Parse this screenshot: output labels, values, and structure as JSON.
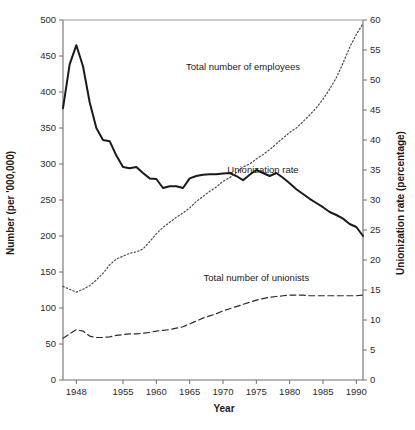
{
  "chart_data": {
    "type": "line",
    "title": "",
    "xlabel": "Year",
    "ylabel": "Number (per '000,000)",
    "y2label": "Unionization rate (percentage)",
    "xlim": [
      1946,
      1991
    ],
    "ylim": [
      0,
      500
    ],
    "y2lim": [
      0,
      60
    ],
    "grid": false,
    "legend_position": "inline-annotations",
    "xticks": [
      1948,
      1955,
      1960,
      1965,
      1970,
      1975,
      1980,
      1985,
      1990
    ],
    "xtick_labels": [
      "1948",
      "1955",
      "1960",
      "1965",
      "1970",
      "1975",
      "1980",
      "1985",
      "1990"
    ],
    "yticks": [
      0,
      50,
      100,
      150,
      200,
      250,
      300,
      350,
      400,
      450,
      500
    ],
    "ytick_labels": [
      "0",
      "50",
      "100",
      "150",
      "200",
      "250",
      "300",
      "350",
      "400",
      "450",
      "500"
    ],
    "y2ticks": [
      0,
      5,
      10,
      15,
      20,
      25,
      30,
      35,
      40,
      45,
      50,
      55,
      60
    ],
    "y2tick_labels": [
      "0",
      "5",
      "10",
      "15",
      "20",
      "25",
      "30",
      "35",
      "40",
      "45",
      "50",
      "55",
      "60"
    ],
    "x": [
      1946,
      1947,
      1948,
      1949,
      1950,
      1951,
      1952,
      1953,
      1954,
      1955,
      1956,
      1957,
      1958,
      1959,
      1960,
      1961,
      1962,
      1963,
      1964,
      1965,
      1966,
      1967,
      1968,
      1969,
      1970,
      1971,
      1972,
      1973,
      1974,
      1975,
      1976,
      1977,
      1978,
      1979,
      1980,
      1981,
      1982,
      1983,
      1984,
      1985,
      1986,
      1987,
      1988,
      1989,
      1990,
      1991
    ],
    "series": [
      {
        "name": "Unionization rate",
        "axis": "right",
        "style": "solid",
        "color": "#1a1a1a",
        "annotation": "Unionization rate",
        "annotation_x": 1976,
        "annotation_y": 34.5,
        "values": [
          45.3,
          52.6,
          55.8,
          52.3,
          46.3,
          42.0,
          40.0,
          39.8,
          37.4,
          35.5,
          35.3,
          35.5,
          34.5,
          33.6,
          33.5,
          32.0,
          32.3,
          32.3,
          32.0,
          33.6,
          34.0,
          34.2,
          34.3,
          34.3,
          34.4,
          34.5,
          34.0,
          33.3,
          34.2,
          35.0,
          34.5,
          34.0,
          34.5,
          33.7,
          32.8,
          31.8,
          31.0,
          30.2,
          29.5,
          28.8,
          28.0,
          27.5,
          26.9,
          26.0,
          25.5,
          24.0
        ],
        "values_left_scale": [
          377.5,
          438.3,
          465.0,
          435.8,
          385.8,
          350.0,
          333.3,
          331.7,
          311.7,
          295.8,
          294.2,
          295.8,
          287.5,
          280.0,
          279.2,
          266.7,
          269.2,
          269.2,
          266.7,
          280.0,
          283.3,
          285.0,
          285.8,
          285.8,
          286.7,
          287.5,
          283.3,
          277.5,
          285.0,
          291.7,
          287.5,
          283.3,
          287.5,
          280.8,
          273.3,
          265.0,
          258.3,
          251.7,
          245.8,
          240.0,
          233.3,
          229.2,
          224.2,
          216.7,
          212.5,
          200.0
        ]
      },
      {
        "name": "Total number of employees",
        "axis": "left",
        "style": "dotted",
        "color": "#4a4a4a",
        "annotation": "Total number of employees",
        "annotation_x": 1973,
        "annotation_y": 430,
        "values": [
          130,
          126,
          122,
          126,
          131,
          139,
          148,
          160,
          168,
          172,
          176,
          178,
          182,
          192,
          203,
          212,
          219,
          226,
          232,
          239,
          248,
          255,
          262,
          268,
          276,
          281,
          288,
          296,
          300,
          307,
          313,
          320,
          328,
          336,
          344,
          350,
          359,
          368,
          378,
          390,
          404,
          420,
          440,
          462,
          480,
          495
        ]
      },
      {
        "name": "Total number of unionists",
        "axis": "left",
        "style": "dashed",
        "color": "#2b2b2b",
        "annotation": "Total number of unionists",
        "annotation_x": 1975,
        "annotation_y": 137,
        "values": [
          58,
          64,
          70,
          68,
          61,
          59,
          59,
          60,
          62,
          63,
          64,
          64,
          65,
          66,
          68,
          69,
          70,
          72,
          74,
          78,
          82,
          86,
          89,
          92,
          96,
          99,
          102,
          105,
          108,
          111,
          113,
          115,
          116,
          117,
          118,
          118,
          118,
          117,
          117,
          117,
          117,
          117,
          117,
          117,
          117,
          118
        ]
      }
    ]
  },
  "axes": {
    "x_title": "Year",
    "y_left_title": "Number (per '000,000)",
    "y_right_title": "Unionization rate (percentage)"
  }
}
